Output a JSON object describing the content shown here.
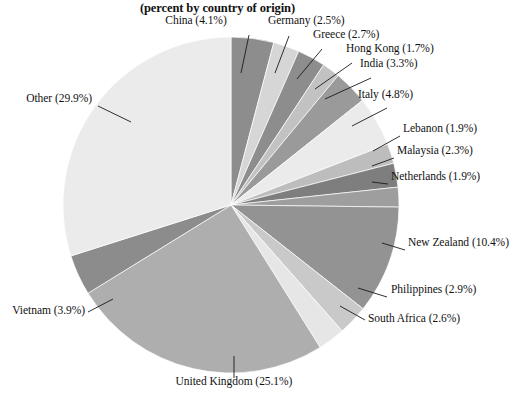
{
  "chart_data": {
    "type": "pie",
    "title": "(percent by country of origin)",
    "subtitle": "",
    "xlabel": "",
    "ylabel": "",
    "legend_position": "none",
    "grid": false,
    "units": "percent",
    "categories": [
      "China",
      "Germany",
      "Greece",
      "Hong Kong",
      "India",
      "Italy",
      "Lebanon",
      "Malaysia",
      "Netherlands",
      "New Zealand",
      "Philippines",
      "South Africa",
      "United Kingdom",
      "Vietnam",
      "Other"
    ],
    "values": [
      4.1,
      2.5,
      2.7,
      1.7,
      3.3,
      4.8,
      1.9,
      2.3,
      1.9,
      10.4,
      2.9,
      2.6,
      25.1,
      3.9,
      29.9
    ],
    "slices": [
      {
        "name": "China",
        "value": 4.1,
        "label": "China (4.1%)",
        "color": "#8d8d8d"
      },
      {
        "name": "Germany",
        "value": 2.5,
        "label": "Germany (2.5%)",
        "color": "#d6d6d6"
      },
      {
        "name": "Greece",
        "value": 2.7,
        "label": "Greece (2.7%)",
        "color": "#8d8d8d"
      },
      {
        "name": "Hong Kong",
        "value": 1.7,
        "label": "Hong Kong (1.7%)",
        "color": "#c2c2c2"
      },
      {
        "name": "India",
        "value": 3.3,
        "label": "India (3.3%)",
        "color": "#9a9a9a"
      },
      {
        "name": "Italy",
        "value": 4.8,
        "label": "Italy (4.8%)",
        "color": "#ebebeb"
      },
      {
        "name": "Lebanon",
        "value": 1.9,
        "label": "Lebanon (1.9%)",
        "color": "#bdbdbd"
      },
      {
        "name": "Malaysia",
        "value": 2.3,
        "label": "Malaysia (2.3%)",
        "color": "#7e7e7e"
      },
      {
        "name": "Netherlands",
        "value": 1.9,
        "label": "Netherlands (1.9%)",
        "color": "#9e9e9e"
      },
      {
        "name": "New Zealand",
        "value": 10.4,
        "label": "New Zealand (10.4%)",
        "color": "#939393"
      },
      {
        "name": "Philippines",
        "value": 2.9,
        "label": "Philippines (2.9%)",
        "color": "#c9c9c9"
      },
      {
        "name": "South Africa",
        "value": 2.6,
        "label": "South Africa (2.6%)",
        "color": "#e6e6e6"
      },
      {
        "name": "United Kingdom",
        "value": 25.1,
        "label": "United Kingdom (25.1%)",
        "color": "#aeaeae"
      },
      {
        "name": "Vietnam",
        "value": 3.9,
        "label": "Vietnam (3.9%)",
        "color": "#8c8c8c"
      },
      {
        "name": "Other",
        "value": 29.9,
        "label": "Other (29.9%)",
        "color": "#ebebeb"
      }
    ],
    "geometry": {
      "cx": 231,
      "cy": 205,
      "r": 168,
      "start_angle_deg": -90
    },
    "labels": [
      {
        "name": "China",
        "text": "China (4.1%)",
        "x": 196,
        "y": 22,
        "align": "center",
        "leader": [
          [
            249,
            35
          ],
          [
            241,
            73
          ]
        ]
      },
      {
        "name": "Germany",
        "text": "Germany (2.5%)",
        "x": 268,
        "y": 22,
        "align": "left",
        "leader": [
          [
            289,
            36
          ],
          [
            275,
            73
          ]
        ]
      },
      {
        "name": "Greece",
        "text": "Greece (2.7%)",
        "x": 313,
        "y": 36,
        "align": "left",
        "leader": [
          [
            322,
            49
          ],
          [
            297,
            79
          ]
        ]
      },
      {
        "name": "Hong Kong",
        "text": "Hong Kong (1.7%)",
        "x": 346,
        "y": 50,
        "align": "left",
        "leader": [
          [
            352,
            63
          ],
          [
            315,
            89
          ]
        ]
      },
      {
        "name": "India",
        "text": "India (3.3%)",
        "x": 360,
        "y": 65,
        "align": "left",
        "leader": [
          [
            371,
            78
          ],
          [
            325,
            99
          ]
        ]
      },
      {
        "name": "Italy",
        "text": "Italy (4.8%)",
        "x": 358,
        "y": 96,
        "align": "left",
        "leader": [
          [
            387,
            108
          ],
          [
            352,
            126
          ]
        ]
      },
      {
        "name": "Lebanon",
        "text": "Lebanon (1.9%)",
        "x": 403,
        "y": 130,
        "align": "left",
        "leader": [
          [
            400,
            136
          ],
          [
            373,
            151
          ]
        ]
      },
      {
        "name": "Malaysia",
        "text": "Malaysia (2.3%)",
        "x": 397,
        "y": 152,
        "align": "left",
        "leader": [
          [
            394,
            158
          ],
          [
            372,
            166
          ]
        ]
      },
      {
        "name": "Netherlands",
        "text": "Netherlands (1.9%)",
        "x": 391,
        "y": 178,
        "align": "left",
        "leader": [
          [
            388,
            184
          ],
          [
            372,
            182
          ]
        ]
      },
      {
        "name": "New Zealand",
        "text": "New Zealand (10.4%)",
        "x": 408,
        "y": 244,
        "align": "left",
        "leader": [
          [
            405,
            250
          ],
          [
            382,
            243
          ]
        ]
      },
      {
        "name": "Philippines",
        "text": "Philippines (2.9%)",
        "x": 391,
        "y": 291,
        "align": "left",
        "leader": [
          [
            387,
            297
          ],
          [
            358,
            288
          ]
        ]
      },
      {
        "name": "South Africa",
        "text": "South Africa (2.6%)",
        "x": 368,
        "y": 320,
        "align": "left",
        "leader": [
          [
            365,
            320
          ],
          [
            340,
            306
          ]
        ]
      },
      {
        "name": "United Kingdom",
        "text": "United Kingdom (25.1%)",
        "x": 234,
        "y": 383,
        "align": "center",
        "leader": [
          [
            234,
            356
          ],
          [
            234,
            378
          ]
        ]
      },
      {
        "name": "Vietnam",
        "text": "Vietnam (3.9%)",
        "x": 85,
        "y": 312,
        "align": "right",
        "leader": [
          [
            88,
            312
          ],
          [
            113,
            299
          ]
        ]
      },
      {
        "name": "Other",
        "text": "Other (29.9%)",
        "x": 92,
        "y": 100,
        "align": "right",
        "leader": [
          [
            98,
            106
          ],
          [
            131,
            122
          ]
        ]
      }
    ]
  }
}
